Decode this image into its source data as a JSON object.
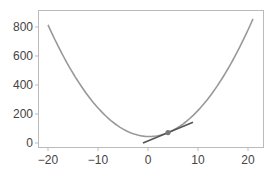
{
  "chart_data": {
    "type": "line",
    "title": "",
    "xlabel": "",
    "ylabel": "",
    "xlim": [
      -22,
      23
    ],
    "ylim": [
      -30,
      920
    ],
    "grid": false,
    "legend": null,
    "x_ticks": [
      -20,
      -10,
      0,
      10,
      20
    ],
    "x_tick_labels": [
      "−20",
      "−10",
      "0",
      "10",
      "20"
    ],
    "y_ticks": [
      0,
      200,
      400,
      600,
      800
    ],
    "y_tick_labels": [
      "0",
      "200",
      "400",
      "600",
      "800"
    ],
    "series": [
      {
        "name": "f(x)",
        "kind": "curve",
        "color": "#999999",
        "function": "1.88*x^2 - 0.87*x + 45",
        "x": [
          -20,
          -16,
          -12,
          -8,
          -4,
          0,
          4,
          8,
          12,
          16,
          21
        ],
        "y": [
          814,
          540,
          326,
          172,
          78,
          45,
          72,
          158,
          305,
          512,
          856
        ]
      },
      {
        "name": "tangent at x=4",
        "kind": "line",
        "color": "#555555",
        "x": [
          -1,
          9
        ],
        "y": [
          0.6,
          142.6
        ]
      },
      {
        "name": "point",
        "kind": "marker",
        "color": "#777777",
        "x": [
          4
        ],
        "y": [
          71.6
        ]
      }
    ]
  },
  "colors": {
    "axis": "#bbbbbb",
    "tick_text": "#444444",
    "curve": "#999999",
    "tangent": "#555555",
    "marker": "#777777"
  }
}
